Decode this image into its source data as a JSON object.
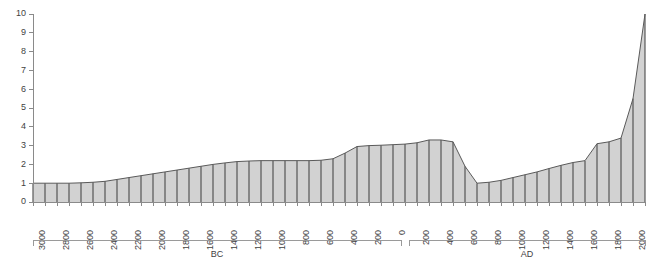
{
  "chart_data": {
    "type": "area",
    "title": "",
    "subtitle": "",
    "xlabel": "",
    "ylabel": "",
    "grid": false,
    "legend": null,
    "xlim": [
      -3100,
      2000
    ],
    "ylim": [
      0,
      10
    ],
    "y_ticks": [
      0,
      1,
      2,
      3,
      4,
      5,
      6,
      7,
      8,
      9,
      10
    ],
    "y_tick_labels": [
      "0",
      "1",
      "2",
      "3",
      "4",
      "5",
      "6",
      "7",
      "8",
      "9",
      "10"
    ],
    "x_tick_labels": [
      "3000",
      "2800",
      "2600",
      "2400",
      "2200",
      "2000",
      "1800",
      "1600",
      "1400",
      "1200",
      "1000",
      "800",
      "600",
      "400",
      "200",
      "0",
      "200",
      "400",
      "600",
      "800",
      "1000",
      "1200",
      "1400",
      "1600",
      "1800",
      "2000"
    ],
    "x_tick_values": [
      -3000,
      -2800,
      -2600,
      -2400,
      -2200,
      -2000,
      -1800,
      -1600,
      -1400,
      -1200,
      -1000,
      -800,
      -600,
      -400,
      -200,
      0,
      200,
      400,
      600,
      800,
      1000,
      1200,
      1400,
      1600,
      1800,
      2000
    ],
    "era_brackets": [
      {
        "label": "BC",
        "from": -3100,
        "to": 0
      },
      {
        "label": "AD",
        "from": 0,
        "to": 2000
      }
    ],
    "x": [
      -3100,
      -3000,
      -2900,
      -2800,
      -2700,
      -2600,
      -2500,
      -2400,
      -2300,
      -2200,
      -2100,
      -2000,
      -1900,
      -1800,
      -1700,
      -1600,
      -1500,
      -1400,
      -1300,
      -1200,
      -1100,
      -1000,
      -900,
      -800,
      -700,
      -600,
      -500,
      -400,
      -300,
      -200,
      -100,
      0,
      100,
      200,
      300,
      400,
      500,
      600,
      700,
      800,
      900,
      1000,
      1100,
      1200,
      1300,
      1400,
      1500,
      1600,
      1700,
      1800,
      1900,
      2000
    ],
    "values": [
      1.0,
      1.0,
      1.0,
      1.0,
      1.02,
      1.05,
      1.1,
      1.2,
      1.3,
      1.4,
      1.5,
      1.6,
      1.7,
      1.8,
      1.9,
      2.0,
      2.08,
      2.15,
      2.18,
      2.2,
      2.2,
      2.2,
      2.2,
      2.2,
      2.22,
      2.3,
      2.6,
      2.95,
      3.0,
      3.02,
      3.05,
      3.08,
      3.15,
      3.3,
      3.3,
      3.2,
      1.9,
      1.0,
      1.05,
      1.15,
      1.3,
      1.45,
      1.6,
      1.78,
      1.95,
      2.1,
      2.2,
      3.1,
      3.2,
      3.4,
      5.5,
      10.0
    ],
    "bar_count": 52,
    "fill_color": "#d2d2d2",
    "line_color": "#4a4a4a",
    "axis_color": "#8a8a8a"
  }
}
